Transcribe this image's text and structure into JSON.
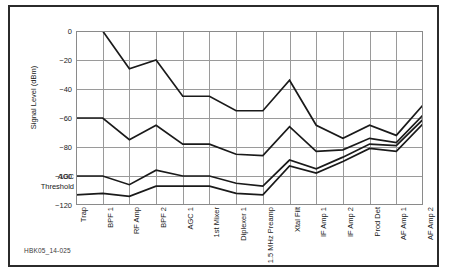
{
  "caption": "HBK05_14-025",
  "axis": {
    "y_title": "Signal Level (dBm)",
    "agc_label_line1": "AGC",
    "agc_label_line2": "Threshold"
  },
  "chart_data": {
    "type": "line",
    "title": "",
    "xlabel": "",
    "ylabel": "Signal Level (dBm)",
    "ylim": [
      -120,
      0
    ],
    "yticks": [
      0,
      -20,
      -40,
      -60,
      -80,
      -100,
      -120
    ],
    "ytick_labels": [
      "0",
      "−20",
      "−40",
      "−60",
      "−80",
      "−100",
      "−120"
    ],
    "grid": true,
    "legend": false,
    "annotations": [
      "AGC Threshold"
    ],
    "categories": [
      "Trap",
      "BPF 1",
      "RF Amp",
      "BPF 2",
      "AGC 1",
      "1st Mixer",
      "Diplexer 1",
      "1.5 MHz Preamp",
      "Xtal Filt",
      "IF Amp 1",
      "IF Amp 2",
      "Prod Det",
      "AF Amp 1",
      "AF Amp 2"
    ],
    "series": [
      {
        "name": "Strong signal",
        "values": [
          0,
          0,
          -26,
          -20,
          -45,
          -45,
          -55,
          -55,
          -34,
          -65,
          -74,
          -65,
          -72,
          -51
        ]
      },
      {
        "name": "Medium signal",
        "values": [
          -60,
          -60,
          -75,
          -65,
          -78,
          -78,
          -85,
          -86,
          -66,
          -83,
          -82,
          -74,
          -77,
          -58
        ]
      },
      {
        "name": "Weak signal",
        "values": [
          -100,
          -100,
          -106,
          -96,
          -100,
          -100,
          -105,
          -107,
          -89,
          -95,
          -87,
          -78,
          -79,
          -61
        ]
      },
      {
        "name": "Noise floor",
        "values": [
          -113,
          -112,
          -114,
          -107,
          -107,
          -107,
          -112,
          -113,
          -93,
          -98,
          -90,
          -81,
          -83,
          -64
        ]
      }
    ]
  }
}
